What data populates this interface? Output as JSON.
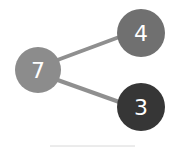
{
  "diagram": {
    "type": "number-bond",
    "whole": {
      "value": "7",
      "color": "#8c8c8c"
    },
    "parts": [
      {
        "value": "4",
        "color": "#707070"
      },
      {
        "value": "3",
        "color": "#363636"
      }
    ],
    "connector_color": "#8f8f8f",
    "baseline_color": "#d8d8d8"
  }
}
